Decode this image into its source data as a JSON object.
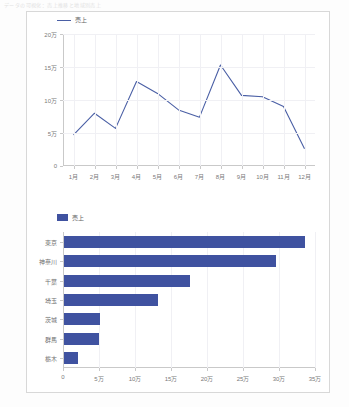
{
  "top_strip": {
    "text": "データの可視化：売上推移と地域別売上"
  },
  "colors": {
    "line": "#4a5fa5",
    "bar": "#3f52a0",
    "grid": "#f0f0f4",
    "axis": "#c9c9c9",
    "frame_border": "#d8d8d8",
    "tick_text": "#7a7a7a"
  },
  "line_chart": {
    "legend": {
      "label": "売上",
      "marker": "line-swatch"
    }
  },
  "bar_chart": {
    "legend": {
      "label": "売上",
      "marker": "box-swatch"
    }
  },
  "chart_data": [
    {
      "type": "line",
      "title": "",
      "xlabel": "",
      "ylabel": "",
      "grid": true,
      "legend_position": "top-left",
      "legend": [
        "売上"
      ],
      "categories": [
        "1月",
        "2月",
        "3月",
        "4月",
        "5月",
        "6月",
        "7月",
        "8月",
        "9月",
        "10月",
        "11月",
        "12月"
      ],
      "y_tick_labels": [
        "0",
        "5万",
        "10万",
        "15万",
        "20万"
      ],
      "y_tick_values": [
        0,
        50000,
        100000,
        150000,
        200000
      ],
      "ylim": [
        0,
        200000
      ],
      "series": [
        {
          "name": "売上",
          "values": [
            47000,
            80000,
            57000,
            128000,
            110000,
            85000,
            74000,
            153000,
            107000,
            105000,
            90000,
            26000
          ]
        }
      ]
    },
    {
      "type": "bar",
      "orientation": "horizontal",
      "title": "",
      "xlabel": "",
      "ylabel": "",
      "grid": true,
      "legend_position": "top-left",
      "legend": [
        "売上"
      ],
      "categories": [
        "東京",
        "神奈川",
        "千葉",
        "埼玉",
        "茨城",
        "群馬",
        "栃木"
      ],
      "values": [
        335000,
        295000,
        175000,
        130000,
        50000,
        48000,
        20000
      ],
      "x_tick_labels": [
        "0",
        "5万",
        "10万",
        "15万",
        "20万",
        "25万",
        "30万",
        "35万"
      ],
      "x_tick_values": [
        0,
        50000,
        100000,
        150000,
        200000,
        250000,
        300000,
        350000
      ],
      "xlim": [
        0,
        350000
      ]
    }
  ]
}
